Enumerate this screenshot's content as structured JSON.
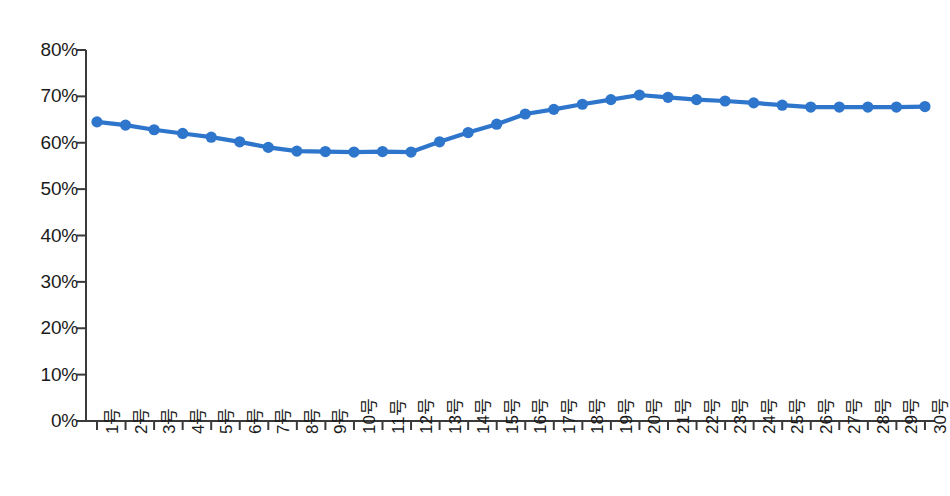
{
  "chart_data": {
    "type": "line",
    "title": "",
    "subtitle": "",
    "xlabel": "",
    "ylabel": "",
    "ylim": [
      0,
      80
    ],
    "y_tick_labels": [
      "80%",
      "70%",
      "60%",
      "50%",
      "40%",
      "30%",
      "20%",
      "10%",
      "0%"
    ],
    "y_ticks": [
      80,
      70,
      60,
      50,
      40,
      30,
      20,
      10,
      0
    ],
    "grid": false,
    "legend": "none",
    "marker": "circle",
    "series_color": "#2E75CC",
    "categories": [
      "1号",
      "2号",
      "3号",
      "4号",
      "5号",
      "6号",
      "7号",
      "8号",
      "9号",
      "10号",
      "11号",
      "12号",
      "13号",
      "14号",
      "15号",
      "16号",
      "17号",
      "18号",
      "19号",
      "20号",
      "21号",
      "22号",
      "23号",
      "24号",
      "25号",
      "26号",
      "27号",
      "28号",
      "29号",
      "30号"
    ],
    "values": [
      64.5,
      63.8,
      62.8,
      62.0,
      61.2,
      60.2,
      59.0,
      58.2,
      58.1,
      58.0,
      58.1,
      58.0,
      60.2,
      62.2,
      64.0,
      66.2,
      67.2,
      68.3,
      69.3,
      70.3,
      69.8,
      69.3,
      69.0,
      68.6,
      68.1,
      67.7,
      67.7,
      67.7,
      67.7,
      67.8
    ]
  }
}
